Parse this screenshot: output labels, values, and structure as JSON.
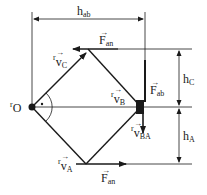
{
  "diagram": {
    "type": "mechanism-kinematics",
    "colors": {
      "line": "#1a1a1a",
      "background": "#ffffff"
    },
    "points": {
      "O": {
        "label": "O",
        "prefix": "r"
      }
    },
    "vectors": {
      "vC": {
        "base": "v",
        "sub": "C",
        "prefix": "r"
      },
      "vB": {
        "base": "v",
        "sub": "B",
        "prefix": "r"
      },
      "vA": {
        "base": "v",
        "sub": "A",
        "prefix": "r"
      },
      "vBA": {
        "base": "v",
        "sub": "BA",
        "prefix": "r"
      }
    },
    "forces": {
      "Fan_top": {
        "base": "F",
        "sub": "an"
      },
      "Fan_bottom": {
        "base": "F",
        "sub": "an"
      },
      "Fab": {
        "base": "F",
        "sub": "ab"
      }
    },
    "dimensions": {
      "hab": {
        "base": "h",
        "sub": "ab"
      },
      "hC": {
        "base": "h",
        "sub": "C"
      },
      "hA": {
        "base": "h",
        "sub": "A"
      }
    }
  }
}
